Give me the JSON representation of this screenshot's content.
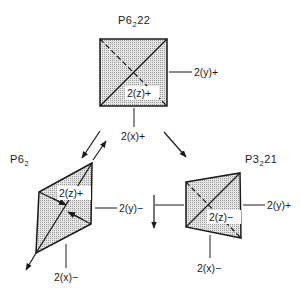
{
  "diagram": {
    "type": "space-group-relationship",
    "colors": {
      "fill": "#d9d9d9",
      "stroke": "#1a1a1a",
      "background": "#ffffff"
    },
    "nodes": [
      {
        "id": "top",
        "title_main": "P6",
        "title_sub": "2",
        "title_tail": "22",
        "shape": "square",
        "axis_labels": {
          "z": "2(z)+",
          "y": "2(y)+",
          "x": "2(x)+"
        }
      },
      {
        "id": "left",
        "title_main": "P6",
        "title_sub": "2",
        "title_tail": "",
        "shape": "parallelogram",
        "axis_labels": {
          "z": "2(z)+",
          "y": "2(y)−",
          "x": "2(x)−"
        }
      },
      {
        "id": "right",
        "title_main": "P3",
        "title_sub": "2",
        "title_tail": "21",
        "shape": "trapezoid",
        "axis_labels": {
          "z": "2(z)−",
          "y": "2(y)+",
          "x": "2(x)−"
        }
      }
    ],
    "edges": [
      {
        "from": "top",
        "to": "left",
        "kind": "double-arrow"
      },
      {
        "from": "top",
        "to": "right",
        "kind": "arrow"
      }
    ]
  }
}
